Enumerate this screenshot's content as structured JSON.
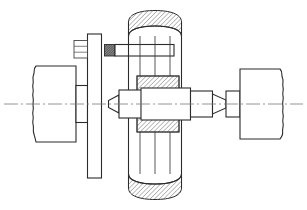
{
  "drawing": {
    "title": "Shaft and bearing assembly sectional view",
    "type": "engineering-line-drawing",
    "projection": "front-elevation-section",
    "canvas": {
      "width": 307,
      "height": 210,
      "background": "#ffffff"
    },
    "colors": {
      "line": "#2b2b2b",
      "thin_line": "#3a3a3a",
      "centerline": "#7a7a7a",
      "hatch": "#2b2b2b",
      "background": "#ffffff",
      "thread_fill": "#5a5a5a"
    },
    "centerline": {
      "y": 104,
      "x_start": 4,
      "x_end": 303
    },
    "components": [
      {
        "id": "left-shaft",
        "label": "Left shaft with break",
        "kind": "shaft",
        "x": 32,
        "y": 66,
        "width": 44,
        "height": 76,
        "break_side": "left",
        "break_amplitude": 3
      },
      {
        "id": "left-shaft-collar",
        "label": "Left shaft collar",
        "kind": "collar",
        "x": 76,
        "y": 85,
        "width": 11,
        "height": 38
      },
      {
        "id": "coupling-flange",
        "label": "Coupling flange disc",
        "kind": "flange",
        "x": 87,
        "y": 34,
        "width": 14,
        "height": 144
      },
      {
        "id": "flange-hex-nut",
        "label": "Hex nut on flange bolt",
        "kind": "nut",
        "x": 74,
        "y": 40,
        "width": 13,
        "height": 18,
        "face_lines": 2
      },
      {
        "id": "tie-rod",
        "label": "Horizontal tie rod",
        "kind": "rod",
        "x": 115,
        "y": 44,
        "width": 59,
        "height": 12
      },
      {
        "id": "tie-rod-thread",
        "label": "Threaded rod end",
        "kind": "thread",
        "x": 105,
        "y": 44,
        "width": 10,
        "height": 12
      },
      {
        "id": "bearing-column",
        "label": "Vertical bearing housing column",
        "kind": "housing",
        "x": 128,
        "y": 10,
        "width": 54,
        "height": 190
      },
      {
        "id": "housing-top-cap",
        "label": "Housing top cap section",
        "kind": "hatched-section",
        "x": 130,
        "y": 12,
        "width": 50,
        "height": 24
      },
      {
        "id": "housing-bottom-cap",
        "label": "Housing bottom cap section",
        "kind": "hatched-section",
        "x": 130,
        "y": 174,
        "width": 50,
        "height": 24
      },
      {
        "id": "bearing-upper",
        "label": "Upper bearing race section",
        "kind": "hatched-section",
        "x": 137,
        "y": 76,
        "width": 42,
        "height": 15
      },
      {
        "id": "bearing-lower",
        "label": "Lower bearing race section",
        "kind": "hatched-section",
        "x": 137,
        "y": 117,
        "width": 42,
        "height": 15
      },
      {
        "id": "center-hub",
        "label": "Central shaft hub",
        "kind": "hub",
        "x": 141,
        "y": 88,
        "width": 49,
        "height": 32
      },
      {
        "id": "hub-left-journal",
        "label": "Left journal block",
        "kind": "journal",
        "x": 119,
        "y": 90,
        "width": 22,
        "height": 28
      },
      {
        "id": "hub-right-journal",
        "label": "Right journal block",
        "kind": "journal",
        "x": 190,
        "y": 91,
        "width": 22,
        "height": 26
      },
      {
        "id": "left-cone",
        "label": "Left conical centre",
        "kind": "cone",
        "x": 108,
        "y": 95,
        "width": 11,
        "height": 18,
        "apex": "left"
      },
      {
        "id": "right-cone",
        "label": "Right conical centre",
        "kind": "cone",
        "x": 212,
        "y": 94,
        "width": 14,
        "height": 20,
        "apex": "left"
      },
      {
        "id": "right-stub",
        "label": "Right shaft stub",
        "kind": "shaft",
        "x": 226,
        "y": 91,
        "width": 14,
        "height": 26
      },
      {
        "id": "right-shaft",
        "label": "Right shaft with break",
        "kind": "shaft",
        "x": 240,
        "y": 69,
        "width": 46,
        "height": 70,
        "break_side": "right",
        "break_amplitude": 3
      }
    ],
    "annotations": {
      "hatch_angle_deg": 45,
      "hatch_spacing_px": 3.2,
      "section_note": "Cross-hatched regions indicate cut material in section"
    }
  }
}
